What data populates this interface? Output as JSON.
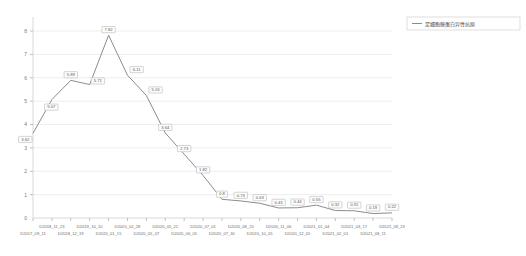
{
  "chart_data": {
    "type": "line",
    "title": "",
    "xlabel": "",
    "ylabel": "",
    "ylim": [
      0,
      8.6
    ],
    "yticks": [
      "1",
      "2",
      "3",
      "4",
      "5",
      "6",
      "7",
      "8"
    ],
    "ytick_values": [
      1,
      2,
      3,
      4,
      5,
      6,
      7,
      8
    ],
    "grid": true,
    "legend_position": "top-right",
    "series_name": "足细胞膜蛋白异性抗原",
    "categories": [
      "D2017_09_11",
      "D2018_11_23",
      "D2018_12_19",
      "D2019_10_10",
      "D2020_01_15",
      "D2020_02_28",
      "D2020_05_07",
      "D2020_05_21",
      "D2020_06_05",
      "D2020_07_01",
      "D2020_07_30",
      "D2020_08_25",
      "D2020_10_05",
      "D2020_11_06",
      "D2020_12_05",
      "D2021_01_04",
      "D2021_02_01",
      "D2021_03_17",
      "D2021_08_11",
      "D2021_09_23"
    ],
    "values": [
      3.62,
      5.07,
      5.89,
      5.71,
      7.82,
      6.11,
      5.24,
      3.64,
      2.73,
      1.82,
      0.8,
      0.73,
      0.63,
      0.43,
      0.44,
      0.55,
      0.32,
      0.31,
      0.19,
      0.22
    ],
    "point_labels": [
      "3.62",
      "5.07",
      "5.89",
      "5.71",
      "7.82",
      "6.11",
      "5.24",
      "3.64",
      "2.73",
      "1.82",
      "0.8",
      "0.73",
      "0.63",
      "0.43",
      "0.44",
      "0.55",
      "0.32",
      "0.31",
      "0.19",
      "0.22"
    ],
    "colors": {
      "line": "#8c8c8c",
      "grid": "#eeeeee",
      "axis": "#d9d9d9",
      "label_text": "#5a5a5a",
      "tick_text": "#6e6e6e"
    }
  },
  "legend": {
    "entries": [
      {
        "label": "足细胞膜蛋白异性抗原",
        "marker": "line-marker"
      }
    ]
  }
}
